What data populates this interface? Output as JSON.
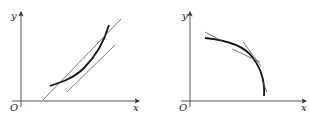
{
  "figures": [
    {
      "id": "left",
      "description": "Increasing convex curve with a tangent line and a steeper secant line",
      "labels": {
        "y_axis": "y",
        "x_axis": "x",
        "origin": "O"
      }
    },
    {
      "id": "right",
      "description": "Decreasing concave curve with tangent lines",
      "labels": {
        "y_axis": "y",
        "x_axis": "x",
        "origin": "O"
      }
    }
  ],
  "colors": {
    "curve": "#111111",
    "axis": "#444444",
    "line": "#555555",
    "background": "#ffffff"
  }
}
